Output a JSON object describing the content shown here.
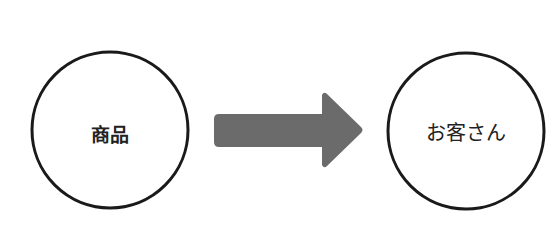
{
  "diagram": {
    "nodes": [
      {
        "id": "product",
        "label": "商品"
      },
      {
        "id": "customer",
        "label": "お客さん"
      }
    ],
    "edges": [
      {
        "from": "product",
        "to": "customer",
        "type": "arrow"
      }
    ],
    "colors": {
      "arrow": "#6b6b6b",
      "circle_stroke": "#1a1a1a"
    }
  }
}
